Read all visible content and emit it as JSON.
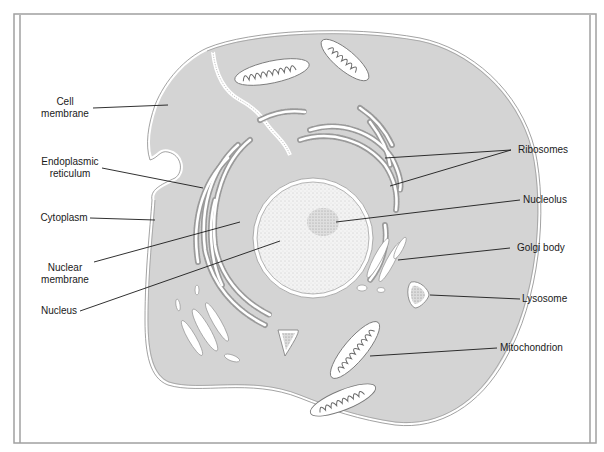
{
  "diagram": {
    "colors": {
      "cytoplasm": "#d4d4d4",
      "membrane": "#8a8a8a",
      "frame": "#9a9a9a",
      "nucleus": "#f2f2f2",
      "organelle_fill": "#ffffff",
      "ribosome": "#8c8c8c",
      "leader_line": "#1a1a1a"
    },
    "labels_left": [
      {
        "id": "cell-membrane",
        "lines": [
          "Cell",
          "membrane"
        ]
      },
      {
        "id": "endoplasmic-reticulum",
        "lines": [
          "Endoplasmic",
          "reticulum"
        ]
      },
      {
        "id": "cytoplasm",
        "lines": [
          "Cytoplasm"
        ]
      },
      {
        "id": "nuclear-membrane",
        "lines": [
          "Nuclear",
          "membrane"
        ]
      },
      {
        "id": "nucleus",
        "lines": [
          "Nucleus"
        ]
      }
    ],
    "labels_right": [
      {
        "id": "ribosomes",
        "lines": [
          "Ribosomes"
        ]
      },
      {
        "id": "nucleolus",
        "lines": [
          "Nucleolus"
        ]
      },
      {
        "id": "golgi-body",
        "lines": [
          "Golgi body"
        ]
      },
      {
        "id": "lysosome",
        "lines": [
          "Lysosome"
        ]
      },
      {
        "id": "mitochondrion",
        "lines": [
          "Mitochondrion"
        ]
      }
    ]
  }
}
